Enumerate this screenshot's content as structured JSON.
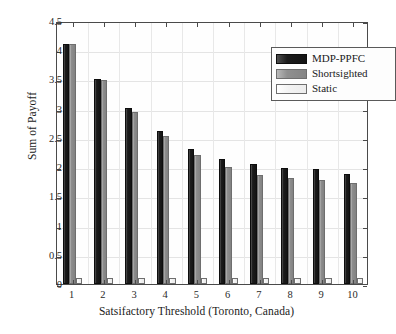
{
  "chart_data": {
    "type": "bar",
    "title": "",
    "xlabel": "Satsifactory Threshold (Toronto, Canada)",
    "ylabel": "Sum of Payoff",
    "categories": [
      "1",
      "2",
      "3",
      "4",
      "5",
      "6",
      "7",
      "8",
      "9",
      "10"
    ],
    "series": [
      {
        "name": "MDP-PPFC",
        "color": "#141414",
        "values": [
          4.11,
          3.51,
          3.01,
          2.61,
          2.31,
          2.14,
          2.06,
          1.99,
          1.96,
          1.89
        ]
      },
      {
        "name": "Shortsighted",
        "color": "#888888",
        "values": [
          4.11,
          3.49,
          2.95,
          2.53,
          2.21,
          2.01,
          1.87,
          1.81,
          1.78,
          1.72
        ]
      },
      {
        "name": "Static",
        "color": "#f0f0f0",
        "values": [
          0.1,
          0.1,
          0.1,
          0.1,
          0.1,
          0.1,
          0.1,
          0.1,
          0.1,
          0.1
        ]
      }
    ],
    "ylim": [
      0,
      4.5
    ],
    "yticks": [
      "0",
      "0.5",
      "1",
      "1.5",
      "2",
      "2.5",
      "3",
      "3.5",
      "4",
      "4.5"
    ],
    "ytick_values": [
      0,
      0.5,
      1,
      1.5,
      2,
      2.5,
      3,
      3.5,
      4,
      4.5
    ],
    "grid": true,
    "legend_position": "top-right"
  },
  "legend": {
    "entries": [
      {
        "label": "MDP-PPFC"
      },
      {
        "label": "Shortsighted"
      },
      {
        "label": "Static"
      }
    ]
  }
}
